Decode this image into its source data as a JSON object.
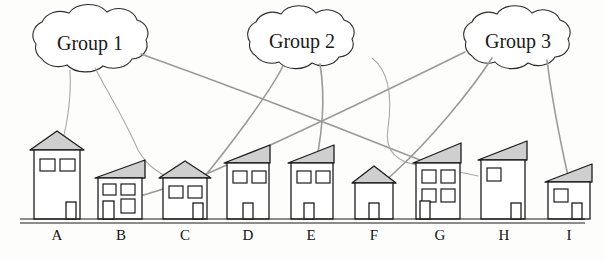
{
  "diagram": {
    "background_color": "#fdfdfb",
    "ink_color": "#1c1c1c",
    "roof_fill": "#cfcfcf",
    "link_color": "#9a9a9a"
  },
  "groups": [
    {
      "id": "group-1",
      "label": "Group 1",
      "cx": 90,
      "cy": 44,
      "rx": 68,
      "ry": 26
    },
    {
      "id": "group-2",
      "label": "Group 2",
      "cx": 302,
      "cy": 42,
      "rx": 62,
      "ry": 24
    },
    {
      "id": "group-3",
      "label": "Group 3",
      "cx": 518,
      "cy": 42,
      "rx": 62,
      "ry": 24
    }
  ],
  "houses": [
    {
      "id": "house-a",
      "label": "A",
      "label_x": 57,
      "style": "peak",
      "windows": 2,
      "door": "right"
    },
    {
      "id": "house-b",
      "label": "B",
      "label_x": 121,
      "style": "slant",
      "windows": 3,
      "door": "left"
    },
    {
      "id": "house-c",
      "label": "C",
      "label_x": 185,
      "style": "peak",
      "windows": 2,
      "door": "right"
    },
    {
      "id": "house-d",
      "label": "D",
      "label_x": 248,
      "style": "slant",
      "windows": 2,
      "door": "center"
    },
    {
      "id": "house-e",
      "label": "E",
      "label_x": 311,
      "style": "slant",
      "windows": 2,
      "door": "center"
    },
    {
      "id": "house-f",
      "label": "F",
      "label_x": 374,
      "style": "peak",
      "windows": 0,
      "door": "center"
    },
    {
      "id": "house-g",
      "label": "G",
      "label_x": 440,
      "style": "slant",
      "windows": 4,
      "door": "left"
    },
    {
      "id": "house-h",
      "label": "H",
      "label_x": 504,
      "style": "slant",
      "windows": 1,
      "door": "right"
    },
    {
      "id": "house-i",
      "label": "I",
      "label_x": 569,
      "style": "slant",
      "windows": 1,
      "door": "center"
    }
  ],
  "connections": [
    {
      "id": "link-g1-a",
      "from": "Group 1",
      "to": "A"
    },
    {
      "id": "link-g1-c",
      "from": "Group 1",
      "to": "C"
    },
    {
      "id": "link-g1-g",
      "from": "Group 1",
      "to": "G"
    },
    {
      "id": "link-g2-d",
      "from": "Group 2",
      "to": "D"
    },
    {
      "id": "link-g2-e",
      "from": "Group 2",
      "to": "E"
    },
    {
      "id": "link-g2-h",
      "from": "Group 2",
      "to": "H"
    },
    {
      "id": "link-g3-b",
      "from": "Group 3",
      "to": "B"
    },
    {
      "id": "link-g3-f",
      "from": "Group 3",
      "to": "F"
    },
    {
      "id": "link-g3-i",
      "from": "Group 3",
      "to": "I"
    }
  ],
  "ground": {
    "id": "ground-line",
    "y": 219
  }
}
